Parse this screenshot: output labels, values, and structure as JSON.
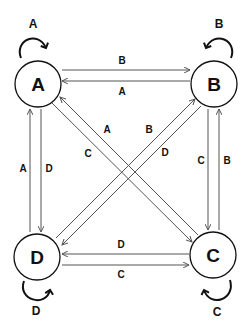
{
  "diagram": {
    "type": "state-transition",
    "nodes": [
      {
        "id": "A",
        "label": "A"
      },
      {
        "id": "B",
        "label": "B"
      },
      {
        "id": "C",
        "label": "C"
      },
      {
        "id": "D",
        "label": "D"
      }
    ],
    "self_loops": [
      {
        "node": "A",
        "label": "A"
      },
      {
        "node": "B",
        "label": "B"
      },
      {
        "node": "C",
        "label": "C"
      },
      {
        "node": "D",
        "label": "D"
      }
    ],
    "edges": [
      {
        "from": "A",
        "to": "B",
        "label": "B"
      },
      {
        "from": "B",
        "to": "A",
        "label": "A"
      },
      {
        "from": "A",
        "to": "D",
        "label": "D"
      },
      {
        "from": "D",
        "to": "A",
        "label": "A"
      },
      {
        "from": "B",
        "to": "C",
        "label": "C"
      },
      {
        "from": "C",
        "to": "B",
        "label": "B"
      },
      {
        "from": "C",
        "to": "D",
        "label": "D"
      },
      {
        "from": "D",
        "to": "C",
        "label": "C"
      },
      {
        "from": "A",
        "to": "C",
        "label": "C"
      },
      {
        "from": "C",
        "to": "A",
        "label": "A"
      },
      {
        "from": "D",
        "to": "B",
        "label": "B"
      },
      {
        "from": "B",
        "to": "D",
        "label": "D"
      }
    ]
  }
}
